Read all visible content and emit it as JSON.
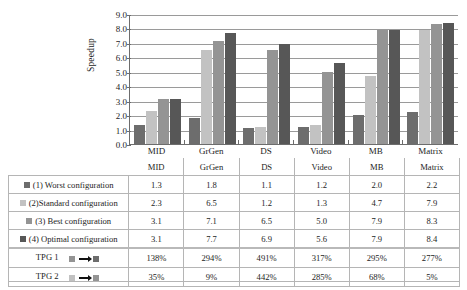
{
  "chart_data": {
    "type": "bar",
    "title": "",
    "xlabel": "",
    "ylabel": "Speedup",
    "ylim": [
      0.0,
      9.0
    ],
    "yticks": [
      "0.0",
      "1.0",
      "2.0",
      "3.0",
      "4.0",
      "5.0",
      "6.0",
      "7.0",
      "8.0",
      "9.0"
    ],
    "grid": true,
    "legend_position": "table-below",
    "categories": [
      "MID",
      "GrGen",
      "DS",
      "Video",
      "MB",
      "Matrix"
    ],
    "series": [
      {
        "name": "(1) Worst configuration",
        "color": "#6d6d6d",
        "values": [
          1.3,
          1.8,
          1.1,
          1.2,
          2.0,
          2.2
        ]
      },
      {
        "name": "(2)Standard configuration",
        "color": "#c2c2c2",
        "values": [
          2.3,
          6.5,
          1.2,
          1.3,
          4.7,
          7.9
        ]
      },
      {
        "name": "(3) Best configuration",
        "color": "#949494",
        "values": [
          3.1,
          7.1,
          6.5,
          5.0,
          7.9,
          8.3
        ]
      },
      {
        "name": "(4) Optimal configuration",
        "color": "#575757",
        "values": [
          3.1,
          7.7,
          6.9,
          5.6,
          7.9,
          8.4
        ]
      }
    ],
    "annotations": [
      {
        "name": "TPG 1",
        "values": [
          "138%",
          "294%",
          "491%",
          "317%",
          "295%",
          "277%"
        ]
      },
      {
        "name": "TPG 2",
        "values": [
          "35%",
          "9%",
          "442%",
          "285%",
          "68%",
          "5%"
        ]
      }
    ]
  },
  "table": {
    "column_headers": [
      "",
      "MID",
      "GrGen",
      "DS",
      "Video",
      "MB",
      "Matrix"
    ],
    "rows": [
      {
        "label": "(1) Worst configuration",
        "swatch": "s1",
        "values": [
          "1.3",
          "1.8",
          "1.1",
          "1.2",
          "2.0",
          "2.2"
        ]
      },
      {
        "label": "(2)Standard configuration",
        "swatch": "s2",
        "values": [
          "2.3",
          "6.5",
          "1.2",
          "1.3",
          "4.7",
          "7.9"
        ]
      },
      {
        "label": "(3) Best configuration",
        "swatch": "s3",
        "values": [
          "3.1",
          "7.1",
          "6.5",
          "5.0",
          "7.9",
          "8.3"
        ]
      },
      {
        "label": "(4) Optimal configuration",
        "swatch": "s4",
        "values": [
          "3.1",
          "7.7",
          "6.9",
          "5.6",
          "7.9",
          "8.4"
        ]
      }
    ],
    "tpg_rows": [
      {
        "label": "TPG 1",
        "from_swatch": "s3",
        "to_swatch": "s1",
        "values": [
          "138%",
          "294%",
          "491%",
          "317%",
          "295%",
          "277%"
        ]
      },
      {
        "label": "TPG 2",
        "from_swatch": "s2",
        "to_swatch": "s3",
        "values": [
          "35%",
          "9%",
          "442%",
          "285%",
          "68%",
          "5%"
        ]
      }
    ]
  }
}
